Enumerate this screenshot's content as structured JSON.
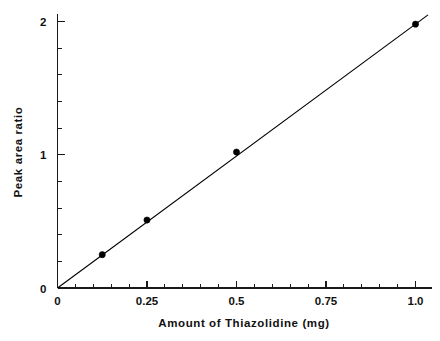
{
  "chart_data": {
    "type": "scatter",
    "title": "",
    "xlabel": "Amount  of  Thiazolidine (mg)",
    "ylabel": "Peak  area  ratio",
    "xlim": [
      0,
      1.0
    ],
    "ylim": [
      0,
      2.08
    ],
    "grid": false,
    "legend": null,
    "x": [
      0.125,
      0.25,
      0.5,
      1.0
    ],
    "y": [
      0.25,
      0.51,
      1.02,
      1.98
    ],
    "series": [
      {
        "name": "Calibration points",
        "x": [
          0.125,
          0.25,
          0.5,
          1.0
        ],
        "values": [
          0.25,
          0.51,
          1.02,
          1.98
        ],
        "marker": "filled-circle",
        "color": "#000000"
      },
      {
        "name": "Regression line",
        "type": "line",
        "x": [
          0.0,
          1.035
        ],
        "values": [
          0.0,
          2.05
        ],
        "color": "#000000"
      }
    ],
    "x_ticks": [
      {
        "value": 0,
        "label": "0"
      },
      {
        "value": 0.25,
        "label": "0.25"
      },
      {
        "value": 0.5,
        "label": "0.5"
      },
      {
        "value": 0.75,
        "label": "0.75"
      },
      {
        "value": 1.0,
        "label": "1.0"
      }
    ],
    "x_minor_step": 0.05,
    "y_ticks": [
      {
        "value": 0,
        "label": "0"
      },
      {
        "value": 1,
        "label": "1"
      },
      {
        "value": 2,
        "label": "2"
      }
    ],
    "y_minor_step": 0.2,
    "axis_color": "#1a1a1a",
    "background_color": "#ffffff"
  }
}
